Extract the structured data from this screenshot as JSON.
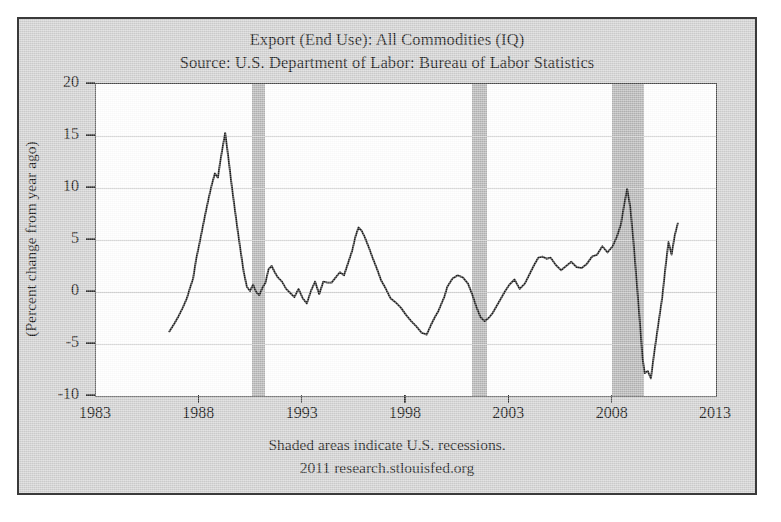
{
  "figure": {
    "background_color": "#cfcfcf",
    "plot_background_color": "#ffffff",
    "recession_band_color": "#b4b4b4",
    "line_color": "#1c1c1c"
  },
  "title": {
    "line1": "Export (End Use): All Commodities (IQ)",
    "line2": "Source: U.S. Department of Labor: Bureau of Labor Statistics"
  },
  "footer": {
    "line1": "Shaded areas indicate U.S. recessions.",
    "line2": "2011 research.stlouisfed.org"
  },
  "axes": {
    "y_title": "(Percent change from year ago)",
    "y_ticks": [
      "20",
      "15",
      "10",
      "5",
      "0",
      "-5",
      "-10"
    ],
    "x_ticks": [
      "1983",
      "1988",
      "1993",
      "1998",
      "2003",
      "2008",
      "2013"
    ]
  },
  "chart_data": {
    "type": "line",
    "title": "Export (End Use): All Commodities (IQ)",
    "subtitle": "Source: U.S. Department of Labor: Bureau of Labor Statistics",
    "xlabel": "",
    "ylabel": "(Percent change from year ago)",
    "xlim": [
      1983,
      2013
    ],
    "ylim": [
      -10,
      20
    ],
    "xticks": [
      1983,
      1988,
      1993,
      1998,
      2003,
      2008,
      2013
    ],
    "yticks": [
      -10,
      -5,
      0,
      5,
      10,
      15,
      20
    ],
    "grid": true,
    "legend": false,
    "annotations": [
      "Shaded areas indicate U.S. recessions.",
      "2011 research.stlouisfed.org"
    ],
    "shaded_regions": [
      {
        "label": "recession 1990-1991",
        "x0": 1990.55,
        "x1": 1991.2
      },
      {
        "label": "recession 2001",
        "x0": 2001.2,
        "x1": 2001.9
      },
      {
        "label": "recession 2007-2009",
        "x0": 2007.95,
        "x1": 2009.5
      }
    ],
    "series": [
      {
        "name": "Export (End Use): All Commodities (IQ)",
        "x": [
          1986.55,
          1986.8,
          1987.0,
          1987.2,
          1987.4,
          1987.55,
          1987.7,
          1987.85,
          1988.0,
          1988.15,
          1988.3,
          1988.45,
          1988.6,
          1988.75,
          1988.9,
          1989.0,
          1989.1,
          1989.25,
          1989.4,
          1989.55,
          1989.7,
          1989.85,
          1990.0,
          1990.15,
          1990.3,
          1990.45,
          1990.6,
          1990.75,
          1990.9,
          1991.05,
          1991.2,
          1991.35,
          1991.5,
          1991.65,
          1991.8,
          1992.0,
          1992.2,
          1992.4,
          1992.6,
          1992.8,
          1993.0,
          1993.2,
          1993.4,
          1993.6,
          1993.8,
          1994.0,
          1994.2,
          1994.4,
          1994.6,
          1994.8,
          1995.0,
          1995.2,
          1995.4,
          1995.55,
          1995.7,
          1995.85,
          1996.0,
          1996.2,
          1996.4,
          1996.6,
          1996.8,
          1997.0,
          1997.25,
          1997.5,
          1997.75,
          1998.0,
          1998.25,
          1998.5,
          1998.75,
          1999.0,
          1999.2,
          1999.4,
          1999.55,
          1999.7,
          1999.85,
          2000.0,
          2000.25,
          2000.5,
          2000.75,
          2001.0,
          2001.2,
          2001.4,
          2001.6,
          2001.8,
          2002.0,
          2002.2,
          2002.4,
          2002.6,
          2002.8,
          2003.0,
          2003.25,
          2003.5,
          2003.75,
          2004.0,
          2004.2,
          2004.4,
          2004.6,
          2004.8,
          2005.0,
          2005.25,
          2005.5,
          2005.75,
          2006.0,
          2006.25,
          2006.5,
          2006.75,
          2007.0,
          2007.25,
          2007.5,
          2007.75,
          2008.0,
          2008.2,
          2008.4,
          2008.55,
          2008.7,
          2008.85,
          2009.0,
          2009.15,
          2009.3,
          2009.45,
          2009.55,
          2009.7,
          2009.85,
          2010.0,
          2010.2,
          2010.4,
          2010.55,
          2010.7,
          2010.85,
          2011.0,
          2011.15
        ],
        "y": [
          -3.8,
          -3.0,
          -2.3,
          -1.5,
          -0.6,
          0.4,
          1.3,
          3.2,
          4.6,
          6.1,
          7.6,
          9.0,
          10.3,
          11.4,
          11.0,
          12.4,
          13.6,
          15.3,
          13.0,
          10.5,
          8.2,
          6.0,
          3.9,
          1.9,
          0.5,
          0.1,
          0.7,
          0.0,
          -0.3,
          0.4,
          0.9,
          2.2,
          2.5,
          1.9,
          1.4,
          1.0,
          0.3,
          -0.1,
          -0.5,
          0.3,
          -0.6,
          -1.1,
          0.1,
          1.0,
          -0.2,
          1.0,
          0.9,
          0.9,
          1.4,
          1.9,
          1.6,
          2.8,
          4.0,
          5.3,
          6.2,
          5.9,
          5.3,
          4.3,
          3.2,
          2.2,
          1.1,
          0.4,
          -0.6,
          -1.0,
          -1.5,
          -2.2,
          -2.8,
          -3.3,
          -3.9,
          -4.1,
          -3.2,
          -2.4,
          -1.9,
          -1.2,
          -0.5,
          0.5,
          1.3,
          1.6,
          1.4,
          0.8,
          -0.2,
          -1.4,
          -2.4,
          -2.8,
          -2.5,
          -2.0,
          -1.3,
          -0.6,
          0.1,
          0.7,
          1.2,
          0.3,
          0.8,
          1.8,
          2.6,
          3.3,
          3.4,
          3.2,
          3.3,
          2.6,
          2.1,
          2.5,
          2.9,
          2.4,
          2.3,
          2.7,
          3.4,
          3.6,
          4.4,
          3.8,
          4.4,
          5.3,
          6.5,
          8.3,
          9.9,
          8.2,
          5.0,
          1.3,
          -2.5,
          -6.4,
          -7.8,
          -7.6,
          -8.3,
          -6.0,
          -3.2,
          -0.5,
          2.3,
          4.8,
          3.6,
          5.4,
          6.6
        ]
      }
    ]
  }
}
